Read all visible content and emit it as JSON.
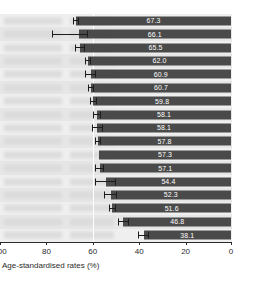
{
  "chart_data": {
    "type": "bar",
    "orientation": "horizontal",
    "title": "",
    "subtitle": "",
    "xlabel": "Age-standardised rates (%)",
    "ylabel": "",
    "xlim": [
      100,
      0
    ],
    "x_axis_reversed": true,
    "xticks": [
      100,
      80,
      60,
      40,
      20,
      0
    ],
    "xtick_labels": [
      "100",
      "80",
      "60",
      "40",
      "20",
      "0"
    ],
    "grid": true,
    "gridlines_at": [
      60
    ],
    "legend": "none",
    "bar_color": "#4a4a4a",
    "band_color": "#efefef",
    "band_color_alt": "#e6e6e6",
    "value_label_color": "#ffffff",
    "error_bar_color": "#1c1c1c",
    "categories": [
      "",
      "",
      "",
      "",
      "",
      "",
      "",
      "",
      "",
      "",
      "",
      "",
      "",
      "",
      "",
      "",
      ""
    ],
    "category_labels_redacted": true,
    "values": [
      67.3,
      66.1,
      65.5,
      62.0,
      60.9,
      60.7,
      59.8,
      58.1,
      58.1,
      57.8,
      57.3,
      57.1,
      54.4,
      52.3,
      51.6,
      46.8,
      38.1
    ],
    "value_labels": [
      "67.3",
      "66.1",
      "65.5",
      "62.0",
      "60.9",
      "60.7",
      "59.8",
      "58.1",
      "58.1",
      "57.8",
      "57.3",
      "57.1",
      "54.4",
      "52.3",
      "51.6",
      "46.8",
      "38.1"
    ],
    "error_low": [
      68.6,
      77.5,
      67.6,
      63.4,
      63.3,
      62.0,
      61.3,
      59.7,
      60.4,
      59.2,
      57.3,
      59.0,
      59.0,
      55.0,
      53.1,
      49.3,
      40.6
    ],
    "error_high": [
      66.0,
      62.2,
      63.4,
      60.6,
      58.5,
      59.4,
      58.3,
      56.5,
      55.8,
      56.4,
      57.3,
      55.2,
      49.8,
      49.6,
      50.1,
      44.3,
      35.6
    ],
    "has_error_bars": [
      true,
      true,
      true,
      true,
      true,
      true,
      true,
      true,
      true,
      true,
      false,
      true,
      true,
      true,
      true,
      true,
      true
    ]
  },
  "axis": {
    "title": "Age-standardised rates (%)"
  }
}
